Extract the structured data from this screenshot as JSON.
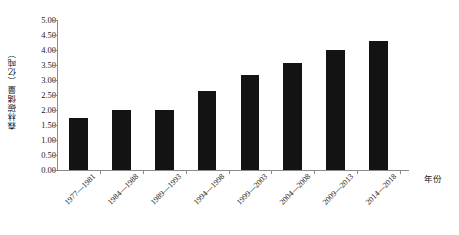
{
  "chart_data": {
    "type": "bar",
    "title": "",
    "xlabel": "年份",
    "ylabel": "森林碳储量（亿吨）",
    "categories": [
      "1977—1981",
      "1984—1988",
      "1989—1993",
      "1994—1998",
      "1999—2003",
      "2004—2008",
      "2009—2013",
      "2014—2018"
    ],
    "values": [
      1.75,
      2.0,
      2.0,
      2.62,
      3.18,
      3.57,
      4.0,
      4.3
    ],
    "series": [
      {
        "name": "森林碳储量",
        "values": [
          1.75,
          2.0,
          2.0,
          2.62,
          3.18,
          3.57,
          4.0,
          4.3
        ]
      }
    ],
    "ylim": [
      0.0,
      5.0
    ],
    "ytick_step": 0.5,
    "ytick_labels": [
      "0.00",
      "0.50",
      "1.00",
      "1.50",
      "2.00",
      "2.50",
      "3.00",
      "3.50",
      "4.00",
      "4.50",
      "5.00"
    ],
    "ytick_values": [
      0.0,
      0.5,
      1.0,
      1.5,
      2.0,
      2.5,
      3.0,
      3.5,
      4.0,
      4.5,
      5.0
    ],
    "grid": false,
    "legend": false,
    "legend_position": "none",
    "bar_color": "#131313",
    "axis_color": "#8a8a8a",
    "text_color": "#1a1a1a",
    "background_color": "#ffffff",
    "xtick_label_rotation": -45
  }
}
